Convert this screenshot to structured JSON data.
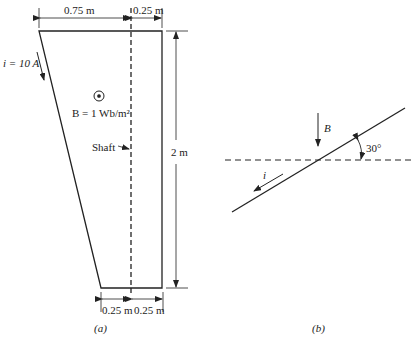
{
  "figure_a": {
    "caption": "(a)",
    "dim_top_left": "0.75 m",
    "dim_top_right": "0.25 m",
    "dim_height": "2 m",
    "dim_bottom_left": "0.25 m",
    "dim_bottom_right": "0.25 m",
    "current_label": "i = 10 A",
    "field_label": "B = 1 Wb/m²",
    "shaft_label": "Shaft",
    "field_symbol": "dot-in-circle (out of page)"
  },
  "figure_b": {
    "caption": "(b)",
    "field_label": "B",
    "current_label": "i",
    "angle_label": "30°"
  },
  "colors": {
    "line": "#222222",
    "background": "#ffffff"
  }
}
